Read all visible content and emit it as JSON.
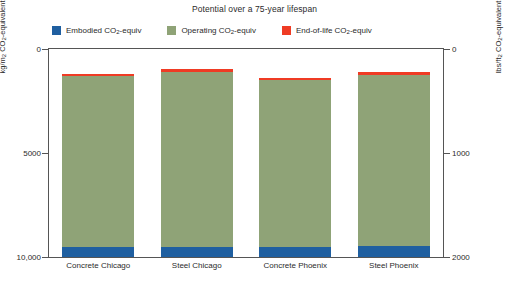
{
  "chart_data": {
    "type": "bar",
    "subtype": "stacked",
    "title": "Potential over a 75-year lifespan",
    "categories": [
      "Concrete Chicago",
      "Steel Chicago",
      "Concrete Phoenix",
      "Steel Phoenix"
    ],
    "series": [
      {
        "name": "Embodied CO2-equiv",
        "key": "embodied",
        "color": "#1f5fa0",
        "values": [
          480,
          500,
          470,
          520
        ]
      },
      {
        "name": "Operating CO2-equiv",
        "key": "operating",
        "color": "#8fa377",
        "values": [
          8200,
          8400,
          8050,
          8250
        ]
      },
      {
        "name": "End-of-life CO2-equiv",
        "key": "endoflife",
        "color": "#ef3b24",
        "values": [
          120,
          130,
          110,
          130
        ]
      }
    ],
    "totals": [
      8800,
      9030,
      8630,
      8900
    ],
    "xlabel": "",
    "ylabel": "kg/m2 CO2-equivalent",
    "ylabel_right": "lbs/ft2 CO2-equivalent",
    "ylim": [
      0,
      10000
    ],
    "ylim_right": [
      0,
      2000
    ],
    "yticks": [
      0,
      5000,
      10000
    ],
    "ytick_labels": [
      "0",
      "5000",
      "10,000"
    ],
    "yticks_right": [
      0,
      1000,
      2000
    ],
    "ytick_labels_right": [
      "0",
      "1000",
      "2000"
    ],
    "grid": false,
    "legend_position": "top"
  },
  "title": {
    "text": "Potential over a 75-year lifespan"
  },
  "legend": {
    "items": [
      {
        "label_main": "Embodied CO",
        "sub": "2",
        "label_tail": "-equiv",
        "color": "#1f5fa0",
        "swatch_name": "embodied-swatch"
      },
      {
        "label_main": "Operating CO",
        "sub": "2",
        "label_tail": "-equiv",
        "color": "#8fa377",
        "swatch_name": "operating-swatch"
      },
      {
        "label_main": "End-of-life CO",
        "sub": "2",
        "label_tail": "-equiv",
        "color": "#ef3b24",
        "swatch_name": "endoflife-swatch"
      }
    ]
  },
  "axes": {
    "left": {
      "title_main": "kg/m",
      "title_sup": "2",
      "title_mid": " CO",
      "title_sub": "2",
      "title_tail": "-equivalent",
      "ticks": [
        "10,000",
        "5000",
        "0"
      ]
    },
    "right": {
      "title_main": "lbs/ft",
      "title_sup": "2",
      "title_mid": " CO",
      "title_sub": "2",
      "title_tail": "-equivalent",
      "ticks": [
        "2000",
        "1000",
        "0"
      ]
    }
  },
  "xaxis": {
    "labels": [
      "Concrete Chicago",
      "Steel Chicago",
      "Concrete Phoenix",
      "Steel Phoenix"
    ]
  }
}
